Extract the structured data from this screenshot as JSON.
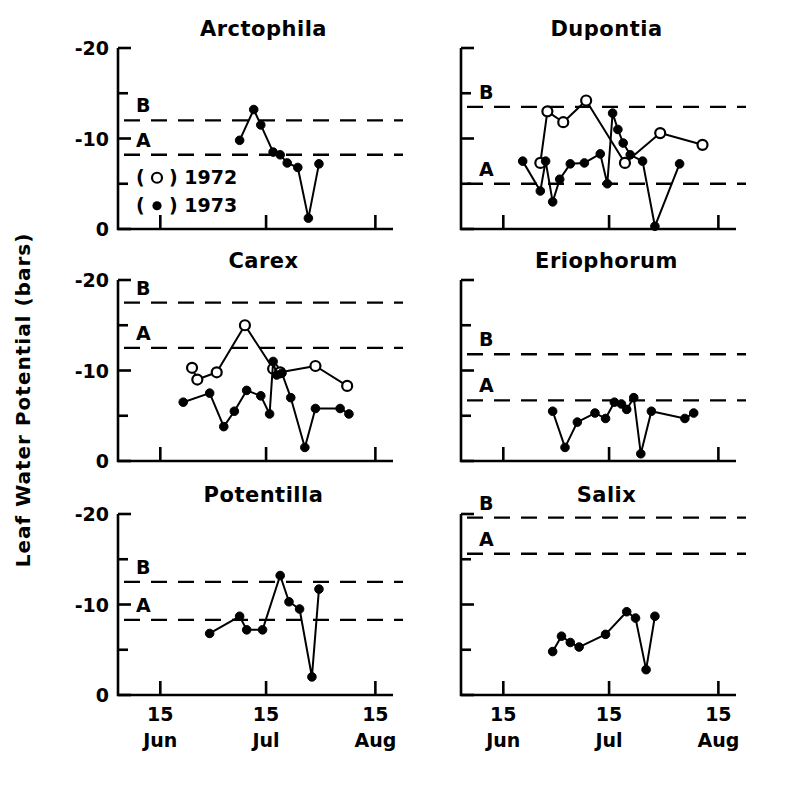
{
  "figure": {
    "ylabel": "Leaf Water Potential  (bars)",
    "legend": [
      {
        "marker": "open-circle",
        "label": "1972"
      },
      {
        "marker": "filled-circle",
        "label": "1973"
      }
    ],
    "legend_text": [
      "( ○ ) 1972",
      "( ● ) 1973"
    ],
    "ytick_labels": [
      "-20",
      "-10",
      "0"
    ],
    "ytick_values": [
      -20,
      -10,
      0
    ],
    "yminor_values": [
      -15,
      -5
    ],
    "xtick_labels_top": [
      "15",
      "15",
      "15"
    ],
    "xtick_labels_bottom": [
      "Jun",
      "Jul",
      "Aug"
    ],
    "xtick_values": [
      0,
      30,
      61
    ],
    "reference_line_labels": [
      "B",
      "A"
    ],
    "ink": "#000000"
  },
  "chart_data": {
    "type": "line",
    "xlabel": "",
    "ylabel": "Leaf Water Potential  (bars)",
    "ylim": [
      -20,
      0
    ],
    "xlim": [
      -12,
      66
    ],
    "grid": false,
    "legend_position": "inside-upper-left-panel-1",
    "x_axis": {
      "tick_values": [
        0,
        30,
        61
      ],
      "tick_labels": [
        "15 Jun",
        "15 Jul",
        "15 Aug"
      ],
      "units": "days from 15 June"
    },
    "panels": [
      {
        "name": "Arctophila",
        "row": 0,
        "col": 0,
        "reference_lines": [
          {
            "label": "B",
            "value": -12.0
          },
          {
            "label": "A",
            "value": -8.2
          }
        ],
        "series": [
          {
            "name": "1972",
            "marker": "open-circle",
            "x": [],
            "y": []
          },
          {
            "name": "1973",
            "marker": "filled-circle",
            "x": [
              22.5,
              26.5,
              28.5,
              32.0,
              34.0,
              36.0,
              39.0,
              42.0,
              45.0
            ],
            "y": [
              -9.8,
              -13.2,
              -11.5,
              -8.5,
              -8.2,
              -7.3,
              -6.8,
              -1.2,
              -7.2
            ]
          }
        ]
      },
      {
        "name": "Dupontia",
        "row": 0,
        "col": 1,
        "reference_lines": [
          {
            "label": "B",
            "value": -13.5
          },
          {
            "label": "A",
            "value": -5.0
          }
        ],
        "series": [
          {
            "name": "1972",
            "marker": "open-circle",
            "x": [
              10.5,
              12.5,
              17.0,
              23.5,
              34.5,
              44.5,
              56.5
            ],
            "y": [
              -7.3,
              -13.0,
              -11.8,
              -14.2,
              -7.3,
              -10.6,
              -9.3
            ]
          },
          {
            "name": "1973",
            "marker": "filled-circle",
            "x": [
              5.5,
              10.5,
              12.0,
              14.0,
              16.0,
              19.0,
              23.0,
              27.5,
              29.5,
              31.0,
              32.5,
              34.0,
              36.0,
              39.5,
              43.0,
              50.0
            ],
            "y": [
              -7.5,
              -4.2,
              -7.5,
              -3.0,
              -5.5,
              -7.2,
              -7.3,
              -8.3,
              -5.0,
              -12.8,
              -11.0,
              -9.5,
              -8.2,
              -7.5,
              -0.3,
              -7.2,
              -7.0
            ]
          }
        ]
      },
      {
        "name": "Carex",
        "row": 1,
        "col": 0,
        "reference_lines": [
          {
            "label": "B",
            "value": -17.5
          },
          {
            "label": "A",
            "value": -12.5
          }
        ],
        "series": [
          {
            "name": "1972",
            "marker": "open-circle",
            "x": [
              9.0,
              10.5,
              16.0,
              24.0,
              32.0,
              34.0,
              44.0,
              53.0
            ],
            "y": [
              -10.3,
              -9.0,
              -9.8,
              -15.0,
              -10.2,
              -9.8,
              -10.5,
              -8.3
            ]
          },
          {
            "name": "1973",
            "marker": "filled-circle",
            "x": [
              6.5,
              14.0,
              18.0,
              21.0,
              24.5,
              28.5,
              31.0,
              32.0,
              33.0,
              34.5,
              37.0,
              41.0,
              44.0,
              51.0,
              53.5
            ],
            "y": [
              -6.5,
              -7.5,
              -3.8,
              -5.5,
              -7.8,
              -7.2,
              -5.2,
              -11.0,
              -9.5,
              -9.7,
              -7.0,
              -1.5,
              -5.8,
              -5.8,
              -5.2
            ]
          }
        ]
      },
      {
        "name": "Eriophorum",
        "row": 1,
        "col": 1,
        "reference_lines": [
          {
            "label": "B",
            "value": -11.8
          },
          {
            "label": "A",
            "value": -6.7
          }
        ],
        "series": [
          {
            "name": "1972",
            "marker": "open-circle",
            "x": [],
            "y": []
          },
          {
            "name": "1973",
            "marker": "filled-circle",
            "x": [
              14.0,
              17.5,
              21.0,
              26.0,
              29.0,
              31.5,
              33.5,
              35.0,
              37.0,
              39.0,
              42.0,
              51.5,
              54.0
            ],
            "y": [
              -5.5,
              -1.5,
              -4.3,
              -5.3,
              -4.7,
              -6.5,
              -6.3,
              -5.7,
              -7.0,
              -0.8,
              -5.5,
              -4.7,
              -5.3
            ]
          }
        ]
      },
      {
        "name": "Potentilla",
        "row": 2,
        "col": 0,
        "reference_lines": [
          {
            "label": "B",
            "value": -12.5
          },
          {
            "label": "A",
            "value": -8.3
          }
        ],
        "series": [
          {
            "name": "1972",
            "marker": "open-circle",
            "x": [],
            "y": []
          },
          {
            "name": "1973",
            "marker": "filled-circle",
            "x": [
              14.0,
              22.5,
              24.5,
              29.0,
              34.0,
              36.5,
              39.5,
              43.0,
              45.0
            ],
            "y": [
              -6.8,
              -8.7,
              -7.2,
              -7.2,
              -13.2,
              -10.3,
              -9.5,
              -2.0,
              -11.7
            ]
          }
        ]
      },
      {
        "name": "Salix",
        "row": 2,
        "col": 1,
        "reference_lines": [
          {
            "label": "B",
            "value": -19.6
          },
          {
            "label": "A",
            "value": -15.6
          }
        ],
        "series": [
          {
            "name": "1972",
            "marker": "open-circle",
            "x": [],
            "y": []
          },
          {
            "name": "1973",
            "marker": "filled-circle",
            "x": [
              14.0,
              16.5,
              19.0,
              21.5,
              29.0,
              35.0,
              37.5,
              40.5,
              43.0
            ],
            "y": [
              -4.8,
              -6.5,
              -5.8,
              -5.3,
              -6.7,
              -9.2,
              -8.5,
              -2.8,
              -8.7
            ]
          }
        ]
      }
    ]
  }
}
